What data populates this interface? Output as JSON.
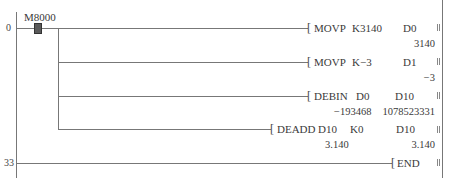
{
  "ladder": {
    "steps": [
      {
        "number": "0"
      },
      {
        "number": "33"
      }
    ],
    "contact": {
      "label": "M8000",
      "type": "normally-open-always-on"
    },
    "instructions": [
      {
        "mnemonic": "MOVP",
        "op1": "K3140",
        "op2": "D0",
        "dest_value": "3140"
      },
      {
        "mnemonic": "MOVP",
        "op1": "K−3",
        "op2": "D1",
        "dest_value": "−3"
      },
      {
        "mnemonic": "DEBIN",
        "op1": "D0",
        "op2": "D10",
        "src_value": "−193468",
        "dest_value": "1078523331"
      },
      {
        "mnemonic": "DEADD",
        "op1": "D10",
        "op2": "K0",
        "op3": "D10",
        "src_value": "3.140",
        "dest_value": "3.140"
      },
      {
        "mnemonic": "END"
      }
    ],
    "bracket_glyph": "[",
    "colors": {
      "line": "#777777",
      "contact": "#5a5a5a",
      "text": "#3a3a3a"
    }
  }
}
